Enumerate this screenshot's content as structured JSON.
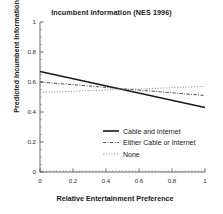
{
  "chart_data": {
    "type": "line",
    "title": "Incumbent Information (NES 1996)",
    "xlabel": "Relative Entertainment Preference",
    "ylabel": "Predicted Incumbent Information",
    "xlim": [
      0,
      1
    ],
    "ylim": [
      0,
      1
    ],
    "xticks": [
      "0",
      "0.2",
      "0.4",
      "0.6",
      "0.8",
      "1"
    ],
    "xtick_values": [
      0,
      0.2,
      0.4,
      0.6,
      0.8,
      1
    ],
    "yticks": [
      "0",
      "0.2",
      "0.4",
      "0.6",
      "0.8",
      "1"
    ],
    "ytick_values": [
      0,
      0.2,
      0.4,
      0.6,
      0.8,
      1
    ],
    "grid": false,
    "legend_position": "lower right",
    "x": [
      0,
      1
    ],
    "series": [
      {
        "name": "Cable and Internet",
        "style": "solid",
        "color": "#1a1a1a",
        "width": 1.6,
        "values": [
          0.67,
          0.43
        ]
      },
      {
        "name": "Either Cable or Internet",
        "style": "dash-dot",
        "color": "#3a3a3a",
        "width": 0.9,
        "values": [
          0.6,
          0.51
        ]
      },
      {
        "name": "None",
        "style": "dotted",
        "color": "#8a8a8a",
        "width": 0.9,
        "values": [
          0.53,
          0.57
        ]
      }
    ]
  },
  "legend": {
    "items": [
      {
        "label": "Cable and Internet"
      },
      {
        "label": "Either Cable or Internet"
      },
      {
        "label": "None"
      }
    ]
  },
  "axes": {
    "x_tick_labels": [
      "0",
      "0.2",
      "0.4",
      "0.6",
      "0.8",
      "1"
    ],
    "y_tick_labels": [
      "0",
      "0.2",
      "0.4",
      "0.6",
      "0.8",
      "1"
    ]
  }
}
